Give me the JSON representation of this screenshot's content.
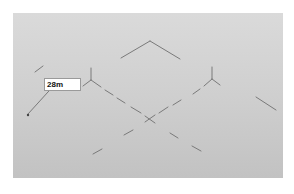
{
  "canvas": {
    "background": "#cfcfcf",
    "line_color": "#7a7a7a"
  },
  "measure_label": {
    "value": "28m"
  }
}
